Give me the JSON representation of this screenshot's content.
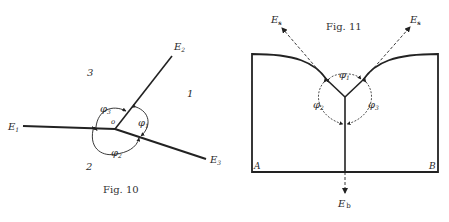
{
  "figures": [
    {
      "caption": "Fig. 10",
      "edge_labels": {
        "e1": "E",
        "e1_sub": "1",
        "e2": "E",
        "e2_sub": "2",
        "e3": "E",
        "e3_sub": "3"
      },
      "region_labels": {
        "r1": "1",
        "r2": "2",
        "r3": "3"
      },
      "angle_labels": {
        "phi1": "φ",
        "phi1_sub": "1",
        "phi2": "φ",
        "phi2_sub": "2",
        "phi3": "φ",
        "phi3_sub": "3"
      },
      "center_mark": "o"
    },
    {
      "caption": "Fig. 11",
      "edge_labels": {
        "es_left": "E",
        "es_left_sub": "s",
        "es_right": "E",
        "es_right_sub": "s",
        "eb": "E",
        "eb_sub": "b"
      },
      "corner_labels": {
        "a": "A",
        "b": "B"
      },
      "angle_labels": {
        "phi1": "φ",
        "phi1_sub": "1",
        "phi2": "φ",
        "phi2_sub": "2",
        "phi3": "φ",
        "phi3_sub": "3"
      }
    }
  ],
  "colors": {
    "ink": "#222222",
    "background": "#ffffff"
  }
}
